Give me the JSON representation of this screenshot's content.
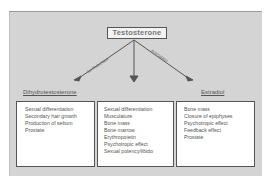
{
  "diagram": {
    "root": "Testosterone",
    "arrows": [
      {
        "label": "5α-Reductase",
        "target": "Dihydrotestosterone"
      },
      {
        "label": "",
        "target": "Direct effects"
      },
      {
        "label": "Aromatase",
        "target": "Estradiol"
      }
    ],
    "branches": {
      "left": {
        "title": "Dihydrotestosterone",
        "items": [
          "Sexual differentiation",
          "Secondary hair growth",
          "Production of sebum",
          "Prostate"
        ]
      },
      "middle": {
        "title": "",
        "items": [
          "Sexual differentiation",
          "Musculature",
          "Bone mass",
          "Bone marrow",
          "Erythropoietin",
          "Psychotropic effect",
          "Sexual potency/libido"
        ]
      },
      "right": {
        "title": "Estradiol",
        "items": [
          "Bone mass",
          "Closure of epiphyses",
          "Psychotropic effect",
          "Feedback effect",
          "Prostate"
        ]
      }
    }
  },
  "colors": {
    "panel": "#d4d4d4",
    "arrow": "#555555",
    "box": "#ffffff",
    "text": "#555555"
  }
}
